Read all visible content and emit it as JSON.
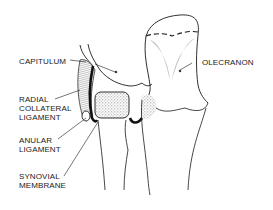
{
  "diagram": {
    "colors": {
      "line": "#1a1a1a",
      "stipple": "#8a8a8a",
      "background": "#ffffff"
    },
    "labels": {
      "capitulum": "CAPITULUM",
      "olecranon": "OLECRANON",
      "radial_collateral_ligament": [
        "RADIAL",
        "COLLATERAL",
        "LIGAMENT"
      ],
      "anular_ligament": [
        "ANULAR",
        "LIGAMENT"
      ],
      "synovial_membrane": [
        "SYNOVIAL",
        "MEMBRANE"
      ]
    }
  }
}
